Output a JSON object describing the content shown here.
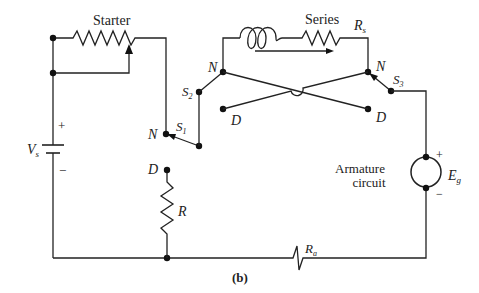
{
  "diagram": {
    "caption": "(b)",
    "labels": {
      "starter": "Starter",
      "series": "Series",
      "series_resistance": "R",
      "series_resistance_sub": "s",
      "supply_voltage": "V",
      "supply_voltage_sub": "s",
      "supply_plus": "+",
      "supply_minus": "−",
      "switch_1": "S",
      "switch_1_sub": "1",
      "switch_2": "S",
      "switch_2_sub": "2",
      "switch_3": "S",
      "switch_3_sub": "3",
      "node_n_s1": "N",
      "node_n_left": "N",
      "node_n_right": "N",
      "node_d_left": "D",
      "node_d_right": "D",
      "node_d_r": "D",
      "resistor_r": "R",
      "armature_line1": "Armature",
      "armature_line2": "circuit",
      "emf": "E",
      "emf_sub": "g",
      "emf_plus": "+",
      "emf_minus": "−",
      "armature_resistance": "R",
      "armature_resistance_sub": "a"
    }
  }
}
